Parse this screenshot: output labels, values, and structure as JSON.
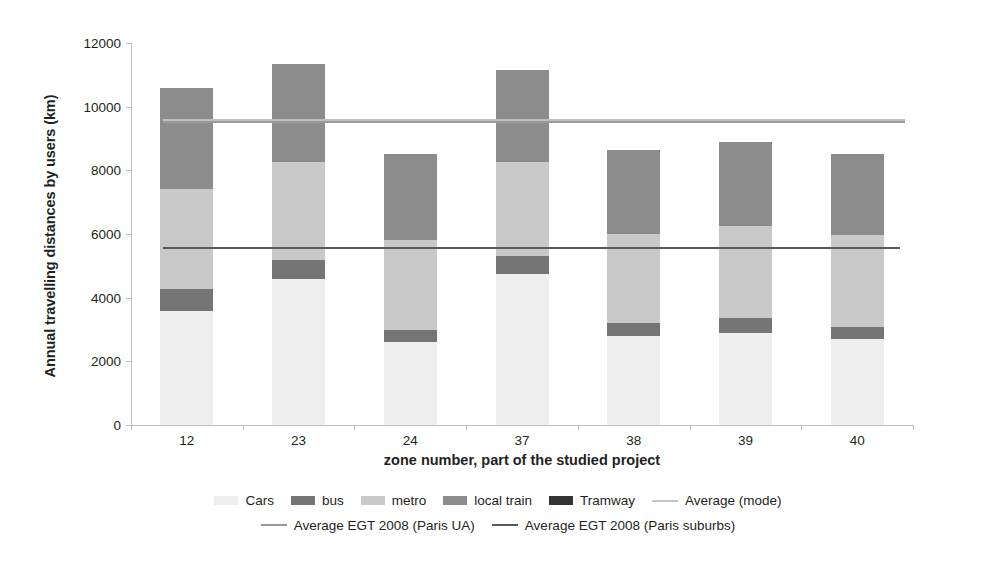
{
  "chart_data": {
    "type": "bar",
    "stacked": true,
    "title": "",
    "xlabel": "zone number, part of the studied project",
    "ylabel": "Annual travelling distances by users (km)",
    "categories": [
      "12",
      "23",
      "24",
      "37",
      "38",
      "39",
      "40"
    ],
    "ylim": [
      0,
      12000
    ],
    "ytick_labels": [
      "0",
      "2000",
      "4000",
      "6000",
      "8000",
      "10000",
      "12000"
    ],
    "yticks": [
      0,
      2000,
      4000,
      6000,
      8000,
      10000,
      12000
    ],
    "grid": false,
    "legend_position": "bottom",
    "series": [
      {
        "name": "Cars",
        "color": "#eeeeee",
        "values": [
          3580,
          4580,
          2620,
          4750,
          2800,
          2900,
          2700
        ]
      },
      {
        "name": "bus",
        "color": "#757575",
        "values": [
          700,
          600,
          380,
          570,
          400,
          450,
          380
        ]
      },
      {
        "name": "metro",
        "color": "#c9c9c9",
        "values": [
          3130,
          3080,
          2800,
          2930,
          2800,
          2900,
          2880
        ]
      },
      {
        "name": "local train",
        "color": "#8c8c8c",
        "values": [
          3170,
          3080,
          2700,
          2900,
          2650,
          2630,
          2540
        ]
      },
      {
        "name": "Tramway",
        "color": "#333333",
        "values": [
          0,
          0,
          0,
          0,
          0,
          0,
          0
        ]
      }
    ],
    "totals": [
      10580,
      11340,
      8500,
      11150,
      8650,
      8880,
      8500
    ],
    "reference_lines": [
      {
        "name": "Average (mode)",
        "value": 9620,
        "color": "#bfbfbf"
      },
      {
        "name": "Average EGT 2008 (Paris UA)",
        "value": 9540,
        "color": "#9a9a9a"
      },
      {
        "name": "Average EGT 2008 (Paris suburbs)",
        "value": 5600,
        "color": "#595959"
      }
    ]
  },
  "legend": {
    "row1": [
      {
        "label": "Cars",
        "type": "swatch",
        "color": "#eeeeee"
      },
      {
        "label": "bus",
        "type": "swatch",
        "color": "#757575"
      },
      {
        "label": "metro",
        "type": "swatch",
        "color": "#c9c9c9"
      },
      {
        "label": "local train",
        "type": "swatch",
        "color": "#8c8c8c"
      },
      {
        "label": "Tramway",
        "type": "swatch",
        "color": "#333333"
      },
      {
        "label": "Average (mode)",
        "type": "line",
        "color": "#c4c4c4"
      }
    ],
    "row2": [
      {
        "label": "Average EGT 2008 (Paris UA)",
        "type": "line",
        "color": "#9a9a9a"
      },
      {
        "label": "Average EGT 2008 (Paris suburbs)",
        "type": "line",
        "color": "#595959"
      }
    ]
  }
}
